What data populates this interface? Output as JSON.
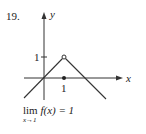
{
  "problem_number": "19.",
  "graph": {
    "x_axis_label": "x",
    "y_axis_label": "y",
    "y_tick_label": "1",
    "x_tick_label": "1",
    "open_point": {
      "x": 1,
      "y": 1
    },
    "filled_point": {
      "x": 1,
      "y": 0
    },
    "line_color": "#333333"
  },
  "limit": {
    "text_lim": "lim",
    "text_expr": "f(x) = 1",
    "subscript": "x→1"
  }
}
